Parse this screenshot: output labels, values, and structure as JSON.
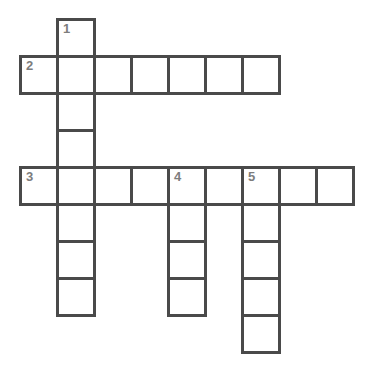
{
  "puzzle": {
    "title": "Crossword Grid",
    "background_color": "#ffffff",
    "cell_fill_color": "#ffffff",
    "border_color": "#4a4a4a",
    "number_color": "#7d7d7d",
    "cell_size": 37,
    "border_width": 3,
    "origin_x": 19,
    "origin_y": 18,
    "grid_columns": 9,
    "grid_rows": 9,
    "entries": [
      {
        "number": "1",
        "direction": "down",
        "length": 5,
        "start_col": 1,
        "start_row": 0
      },
      {
        "number": "2",
        "direction": "across",
        "length": 7,
        "start_col": 0,
        "start_row": 1
      },
      {
        "number": "3",
        "direction": "across",
        "length": 9,
        "start_col": 0,
        "start_row": 4
      },
      {
        "number": "4",
        "direction": "down",
        "length": 4,
        "start_col": 4,
        "start_row": 4
      },
      {
        "number": "5",
        "direction": "down",
        "length": 5,
        "start_col": 6,
        "start_row": 4
      }
    ],
    "cells": [
      {
        "col": 1,
        "row": 0,
        "number": "1"
      },
      {
        "col": 0,
        "row": 1,
        "number": "2"
      },
      {
        "col": 1,
        "row": 1,
        "number": ""
      },
      {
        "col": 2,
        "row": 1,
        "number": ""
      },
      {
        "col": 3,
        "row": 1,
        "number": ""
      },
      {
        "col": 4,
        "row": 1,
        "number": ""
      },
      {
        "col": 5,
        "row": 1,
        "number": ""
      },
      {
        "col": 6,
        "row": 1,
        "number": ""
      },
      {
        "col": 1,
        "row": 2,
        "number": ""
      },
      {
        "col": 1,
        "row": 3,
        "number": ""
      },
      {
        "col": 0,
        "row": 4,
        "number": "3"
      },
      {
        "col": 1,
        "row": 4,
        "number": ""
      },
      {
        "col": 2,
        "row": 4,
        "number": ""
      },
      {
        "col": 3,
        "row": 4,
        "number": ""
      },
      {
        "col": 4,
        "row": 4,
        "number": "4"
      },
      {
        "col": 5,
        "row": 4,
        "number": ""
      },
      {
        "col": 6,
        "row": 4,
        "number": "5"
      },
      {
        "col": 7,
        "row": 4,
        "number": ""
      },
      {
        "col": 8,
        "row": 4,
        "number": ""
      },
      {
        "col": 1,
        "row": 5,
        "number": ""
      },
      {
        "col": 4,
        "row": 5,
        "number": ""
      },
      {
        "col": 6,
        "row": 5,
        "number": ""
      },
      {
        "col": 1,
        "row": 6,
        "number": ""
      },
      {
        "col": 4,
        "row": 6,
        "number": ""
      },
      {
        "col": 6,
        "row": 6,
        "number": ""
      },
      {
        "col": 1,
        "row": 7,
        "number": ""
      },
      {
        "col": 4,
        "row": 7,
        "number": ""
      },
      {
        "col": 6,
        "row": 7,
        "number": ""
      },
      {
        "col": 6,
        "row": 8,
        "number": ""
      }
    ]
  }
}
